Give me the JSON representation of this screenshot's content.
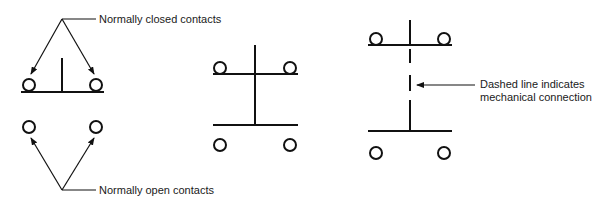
{
  "diagram": {
    "labels": {
      "normally_closed": "Normally closed contacts",
      "normally_open": "Normally open contacts",
      "dashed_line_1": "Dashed line indicates",
      "dashed_line_2": "mechanical connection"
    },
    "groups": [
      {
        "name": "nc-and-no-contacts",
        "elements": [
          "normally closed contacts",
          "normally open contacts"
        ]
      },
      {
        "name": "double-pole-contacts",
        "elements": [
          "top contact pair",
          "bottom contact pair",
          "solid connector"
        ]
      },
      {
        "name": "mechanically-linked-contacts",
        "elements": [
          "top contact pair",
          "bottom contact pair",
          "dashed mechanical link"
        ]
      }
    ],
    "colors": {
      "stroke": "#111111",
      "background": "#ffffff"
    }
  }
}
